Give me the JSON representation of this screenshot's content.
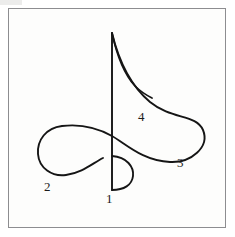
{
  "figure": {
    "background_color": "#fdfdfc",
    "border_color": "#8d8d90",
    "stroke_color": "#151515",
    "width": 235,
    "height": 237
  },
  "labels": [
    {
      "id": "1",
      "text": "1",
      "x": 106,
      "y": 192
    },
    {
      "id": "2",
      "text": "2",
      "x": 44,
      "y": 180
    },
    {
      "id": "3",
      "text": "3",
      "x": 177,
      "y": 156
    },
    {
      "id": "4",
      "text": "4",
      "x": 138,
      "y": 110
    }
  ],
  "strokes": {
    "vertical_line": {
      "name": "vertical-axis-line",
      "x1": 112,
      "y1": 33,
      "x2": 112,
      "y2": 190
    },
    "main_curve": {
      "name": "main-looping-curve",
      "path": "M 112,33 C 119,62 131,86 150,102 C 172,120 196,114 203,130 C 210,147 191,163 170,162 C 143,161 126,144 112,136 C 96,127 78,124 62,126 C 46,128 37,140 38,154 C 39,168 52,177 66,175 C 82,173 93,163 103,158"
    },
    "inner_branch": {
      "name": "inner-cusp-branch",
      "path": "M 112,33 C 117,56 124,74 135,86 C 142,93 148,96 152,98"
    },
    "bottom_hook": {
      "name": "bottom-semicircular-hook",
      "path": "M 112,156 C 127,157 134,167 133,176 C 132,185 124,190 112,190"
    }
  }
}
